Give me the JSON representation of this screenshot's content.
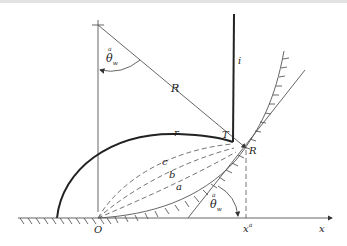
{
  "figure": {
    "labels": {
      "center_theta": "θ",
      "center_theta_sup": "a",
      "center_theta_sub": "w",
      "radius": "R",
      "line_i": "i",
      "curve_r": "r",
      "point_T": "T",
      "point_R": "R",
      "curve_c": "c",
      "curve_b": "b",
      "curve_a": "a",
      "origin": "O",
      "wall_theta": "θ",
      "wall_theta_sup": "a",
      "wall_theta_sub": "w",
      "x_a": "x",
      "x_a_sup": "a",
      "x_axis": "x"
    },
    "colors": {
      "line": "#555555",
      "thick_line": "#222222",
      "dashed": "#666666"
    }
  }
}
